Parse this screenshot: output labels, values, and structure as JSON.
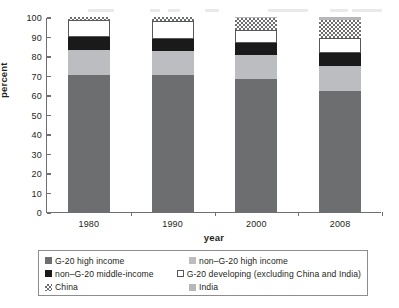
{
  "chart_data": {
    "type": "bar",
    "stacked": true,
    "title": "",
    "xlabel": "year",
    "ylabel": "percent",
    "categories": [
      "1980",
      "1990",
      "2000",
      "2008"
    ],
    "ylim": [
      0,
      100
    ],
    "yticks": [
      0,
      10,
      20,
      30,
      40,
      50,
      60,
      70,
      80,
      90,
      100
    ],
    "grid": false,
    "legend_position": "bottom",
    "series": [
      {
        "name": "G-20 high income",
        "fill": "dark",
        "values": [
          70.5,
          70.5,
          68.0,
          62.0
        ]
      },
      {
        "name": "non-G-20 high income",
        "fill": "light",
        "values": [
          12.5,
          12.0,
          12.5,
          13.0
        ]
      },
      {
        "name": "non–G-20 middle-income",
        "fill": "black",
        "values": [
          7.0,
          6.0,
          6.0,
          6.5
        ]
      },
      {
        "name": "G-20 developing (excluding China and India)",
        "fill": "white",
        "values": [
          8.5,
          9.5,
          7.0,
          8.0
        ]
      },
      {
        "name": "China",
        "fill": "check",
        "values": [
          1.5,
          2.0,
          6.0,
          9.0
        ]
      },
      {
        "name": "India",
        "fill": "india",
        "values": [
          0.0,
          0.0,
          0.5,
          1.5
        ]
      }
    ]
  },
  "legend": {
    "items": [
      {
        "label": "G-20 high income",
        "swatch": "dark"
      },
      {
        "label": "non–G-20 high income",
        "swatch": "light"
      },
      {
        "label": "non–G-20 middle-income",
        "swatch": "black"
      },
      {
        "label": "G-20 developing (excluding China and India)",
        "swatch": "white"
      },
      {
        "label": "China",
        "swatch": "check"
      },
      {
        "label": "India",
        "swatch": "india"
      }
    ]
  }
}
